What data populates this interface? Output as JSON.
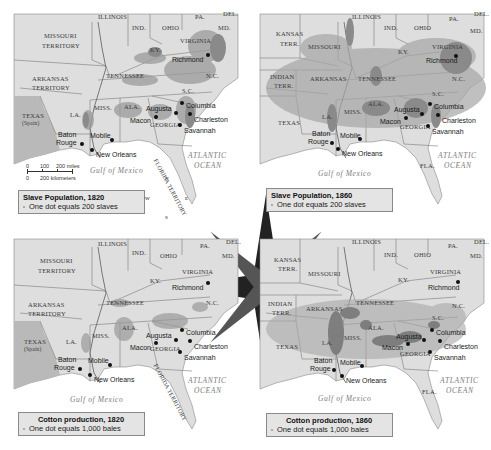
{
  "figure": {
    "panels": [
      {
        "id": "slave-1820",
        "legend": {
          "title": "Slave Population, 1820",
          "key": "One dot equals 200 slaves"
        },
        "territories": [
          "MISSOURI TERRITORY",
          "ARKANSAS TERRITORY",
          "TEXAS (Spain)",
          "FLORIDA TERRITORY"
        ],
        "states": [
          "ILLINOIS",
          "IND.",
          "OHIO",
          "PA.",
          "DEL.",
          "MD.",
          "VIRGINIA",
          "KY.",
          "TENNESSEE",
          "N.C.",
          "S.C.",
          "GEORGIA",
          "ALA.",
          "MISS.",
          "LA."
        ]
      },
      {
        "id": "slave-1860",
        "legend": {
          "title": "Slave Population, 1860",
          "key": "One dot equals 200 slaves"
        },
        "territories": [
          "KANSAS TERR.",
          "INDIAN TERR."
        ],
        "states": [
          "ILLINOIS",
          "IND.",
          "OHIO",
          "PA.",
          "DEL.",
          "MD.",
          "MISSOURI",
          "VIRGINIA",
          "KY.",
          "ARKANSAS",
          "TENNESSEE",
          "N.C.",
          "S.C.",
          "GEORGIA",
          "ALA.",
          "MISS.",
          "LA.",
          "TEXAS",
          "FLA."
        ]
      },
      {
        "id": "cotton-1820",
        "legend": {
          "title": "Cotton production, 1820",
          "key": "One dot equals 1,000 bales"
        },
        "territories": [
          "MISSOURI TERRITORY",
          "ARKANSAS TERRITORY",
          "TEXAS (Spain)",
          "FLORIDA TERRITORY"
        ],
        "states": [
          "ILLINOIS",
          "IND.",
          "OHIO",
          "PA.",
          "DEL.",
          "MD.",
          "VIRGINIA",
          "KY.",
          "TENNESSEE",
          "N.C.",
          "S.C.",
          "GEORGIA",
          "ALA.",
          "MISS.",
          "LA."
        ]
      },
      {
        "id": "cotton-1860",
        "legend": {
          "title": "Cotton production, 1860",
          "key": "One dot equals 1,000 bales"
        },
        "territories": [
          "KANSAS TERR.",
          "INDIAN TERR."
        ],
        "states": [
          "ILLINOIS",
          "IND.",
          "OHIO",
          "PA.",
          "DEL.",
          "MD.",
          "MISSOURI",
          "VIRGINIA",
          "KY.",
          "ARKANSAS",
          "TENNESSEE",
          "N.C.",
          "S.C.",
          "GEORGIA",
          "ALA.",
          "MISS.",
          "LA.",
          "TEXAS",
          "FLA."
        ]
      }
    ],
    "labels": {
      "illinois": "ILLINOIS",
      "ind": "IND.",
      "ohio": "OHIO",
      "pa": "PA.",
      "del": "DEL.",
      "md": "MD.",
      "virginia": "VIRGINIA",
      "ky": "KY.",
      "tennessee": "TENNESSEE",
      "nc": "N.C.",
      "sc": "S.C.",
      "georgia": "GEORGIA",
      "ala": "ALA.",
      "miss": "MISS.",
      "la": "LA.",
      "missouri_terr_1": "MISSOURI",
      "missouri_terr_2": "TERRITORY",
      "arkansas_terr_1": "ARKANSAS",
      "arkansas_terr_2": "TERRITORY",
      "texas": "TEXAS",
      "spain": "(Spain)",
      "florida_terr": "FLORIDA TERRITORY",
      "kansas_1": "KANSAS",
      "kansas_2": "TERR.",
      "indian_1": "INDIAN",
      "indian_2": "TERR.",
      "missouri": "MISSOURI",
      "arkansas": "ARKANSAS",
      "texas_state": "TEXAS",
      "fla": "FLA."
    },
    "cities": {
      "richmond": "Richmond",
      "columbia": "Columbia",
      "charleston": "Charleston",
      "savannah": "Savannah",
      "augusta": "Augusta",
      "macon": "Macon",
      "mobile": "Mobile",
      "baton_1": "Baton",
      "baton_2": "Rouge",
      "new_orleans": "New Orleans"
    },
    "water": {
      "gulf": "Gulf of Mexico",
      "atlantic_1": "ATLANTIC",
      "atlantic_2": "OCEAN"
    },
    "rivers": [
      "Mississippi R.",
      "Ohio R.",
      "Arkansas R.",
      "Red R.",
      "Cumberland R.",
      "Tennessee R."
    ],
    "scale_bar": {
      "miles": [
        "0",
        "100",
        "200 miles"
      ],
      "km": [
        "0",
        "200 kilometers"
      ]
    },
    "compass": {
      "n": "N",
      "s": "S",
      "e": "E",
      "w": "W"
    },
    "colors": {
      "land": "#dedede",
      "water": "#ffffff",
      "dense": "#8c8c8c",
      "dots": "#9a9a9a",
      "border": "#777777",
      "texas_shade": "#b9b9b9"
    }
  }
}
